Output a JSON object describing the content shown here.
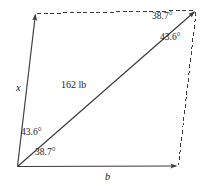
{
  "figure": {
    "type": "parallelogram-force-diagram",
    "background_color": "#ffffff",
    "stroke_color": "#3a3a3a",
    "labels": {
      "side_left": "x",
      "side_bottom": "b",
      "diagonal_magnitude": "162 lb",
      "angle_bottom_left_upper": "43.6°",
      "angle_bottom_left_lower": "38.7°",
      "angle_top_right_upper": "38.7°",
      "angle_top_right_lower": "43.6°"
    },
    "geometry": {
      "vertex_bottom_left": [
        17,
        167
      ],
      "vertex_top_left": [
        36,
        13
      ],
      "vertex_top_right": [
        196,
        10
      ],
      "vertex_bottom_right": [
        178,
        166
      ]
    },
    "icons": {
      "arrowhead_left_side": "arrow-up-icon",
      "arrowhead_bottom_side": "arrow-right-icon",
      "arrowhead_diagonal": "arrow-up-right-icon"
    }
  }
}
